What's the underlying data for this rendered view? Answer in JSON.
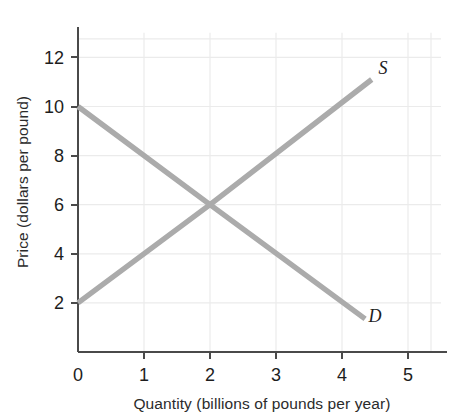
{
  "chart_data": {
    "type": "line",
    "title": "",
    "xlabel": "Quantity (billions of pounds per year)",
    "ylabel": "Price (dollars per pound)",
    "xlim": [
      0,
      5.5
    ],
    "ylim": [
      0,
      13
    ],
    "xticks": [
      "0",
      "1",
      "2",
      "3",
      "4",
      "5"
    ],
    "xtick_values": [
      0,
      1,
      2,
      3,
      4,
      5
    ],
    "yticks": [
      "2",
      "4",
      "6",
      "8",
      "10",
      "12"
    ],
    "ytick_values": [
      2,
      4,
      6,
      8,
      10,
      12
    ],
    "y_origin_label": "0",
    "grid": true,
    "grid_color": "#ebebeb",
    "legend_position": "inline-curve-end",
    "series": [
      {
        "name": "Supply",
        "label": "S",
        "color": "#ababab",
        "points": [
          {
            "x": 0.0,
            "y": 2.0
          },
          {
            "x": 2.0,
            "y": 6.0
          },
          {
            "x": 4.45,
            "y": 11.1
          }
        ]
      },
      {
        "name": "Demand",
        "label": "D",
        "color": "#ababab",
        "points": [
          {
            "x": 0.0,
            "y": 10.0
          },
          {
            "x": 2.0,
            "y": 6.0
          },
          {
            "x": 4.35,
            "y": 1.35
          }
        ]
      }
    ],
    "equilibrium": {
      "x": 2,
      "y": 6
    },
    "annotations": [
      {
        "text": "S",
        "x": 4.62,
        "y": 11.55
      },
      {
        "text": "D",
        "x": 4.5,
        "y": 1.45
      }
    ]
  },
  "axes": {
    "axis_line_color": "#4a4a4a",
    "tick_color": "#4a4a4a"
  }
}
